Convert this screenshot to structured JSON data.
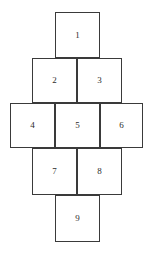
{
  "figure": {
    "background_color": "#ffffff",
    "line_color": "#3a3a3a",
    "label_color": "#2b2b2b"
  },
  "chart_data": {
    "type": "diagram",
    "title": "",
    "rows": [
      {
        "row": 1,
        "count": 1,
        "labels": [
          "1"
        ]
      },
      {
        "row": 2,
        "count": 2,
        "labels": [
          "2",
          "3"
        ]
      },
      {
        "row": 3,
        "count": 3,
        "labels": [
          "4",
          "5",
          "6"
        ]
      },
      {
        "row": 4,
        "count": 2,
        "labels": [
          "7",
          "8"
        ]
      },
      {
        "row": 5,
        "count": 1,
        "labels": [
          "9"
        ]
      }
    ],
    "labels": [
      "1",
      "2",
      "3",
      "4",
      "5",
      "6",
      "7",
      "8",
      "9"
    ]
  },
  "cells": {
    "c1": "1",
    "c2": "2",
    "c3": "3",
    "c4": "4",
    "c5": "5",
    "c6": "6",
    "c7": "7",
    "c8": "8",
    "c9": "9"
  }
}
